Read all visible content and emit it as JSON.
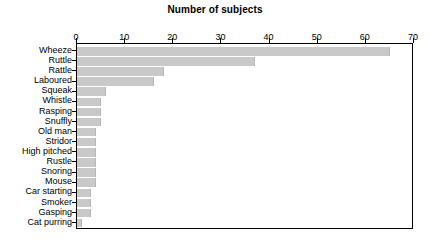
{
  "chart_data": {
    "type": "bar",
    "orientation": "horizontal",
    "title": "Number of subjects",
    "xlabel": "",
    "ylabel": "",
    "xlim": [
      0,
      70
    ],
    "ylim": null,
    "grid": false,
    "legend": null,
    "xticks": [
      0,
      10,
      20,
      30,
      40,
      50,
      60,
      70
    ],
    "xtick_labels": [
      "0",
      "10",
      "20",
      "30",
      "40",
      "50",
      "60",
      "70"
    ],
    "categories": [
      "Wheeze",
      "Ruttle",
      "Rattle",
      "Laboured",
      "Squeak",
      "Whistle",
      "Rasping",
      "Snuffly",
      "Old man",
      "Stridor",
      "High pitched",
      "Rustle",
      "Snoring",
      "Mouse",
      "Car starting",
      "Smoker",
      "Gasping",
      "Cat purring"
    ],
    "values": [
      65,
      37,
      18,
      16,
      6,
      5,
      5,
      5,
      4,
      4,
      4,
      4,
      4,
      4,
      3,
      3,
      3,
      1
    ],
    "bar_color": "#c9c9c9",
    "bar_edge_color": "#b6b6b6",
    "axis_color": "#000000",
    "background_color": "#ffffff"
  }
}
